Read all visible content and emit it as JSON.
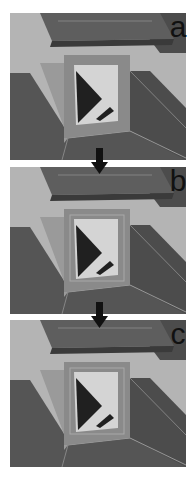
{
  "figure": {
    "panels": [
      {
        "id": "a",
        "label": "a",
        "variant": "single-frame"
      },
      {
        "id": "b",
        "label": "b",
        "variant": "double-frame"
      },
      {
        "id": "c",
        "label": "c",
        "variant": "double-frame"
      }
    ],
    "arrows": [
      {
        "from": "a",
        "to": "b",
        "icon": "down-arrow-icon"
      },
      {
        "from": "b",
        "to": "c",
        "icon": "down-arrow-icon"
      }
    ],
    "colors": {
      "background": "#ffffff",
      "light_wall": "#b4b4b4",
      "mid_wall": "#9a9a9a",
      "dark_floor": "#555555",
      "dark_wall": "#4c4c4c",
      "roof_top": "#5e5e5e",
      "roof_front": "#3a3a3a",
      "frame": "#8a8a8a",
      "glass": "#d4d4d4",
      "shadow": "#202020",
      "edge_highlight": "#a8a8a8",
      "arrow": "#111111",
      "label": "#111111"
    }
  }
}
